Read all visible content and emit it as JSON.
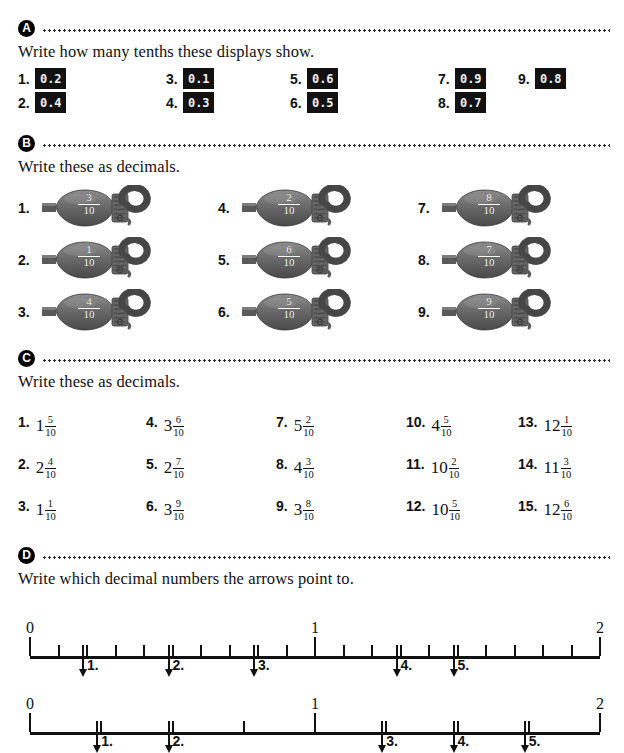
{
  "sections": {
    "a": {
      "badge": "A",
      "instruction": "Write how many tenths these displays show.",
      "items": [
        {
          "num": "1.",
          "display": "0.2"
        },
        {
          "num": "2.",
          "display": "0.4"
        },
        {
          "num": "3.",
          "display": "0.1"
        },
        {
          "num": "4.",
          "display": "0.3"
        },
        {
          "num": "5.",
          "display": "0.6"
        },
        {
          "num": "6.",
          "display": "0.5"
        },
        {
          "num": "7.",
          "display": "0.9"
        },
        {
          "num": "8.",
          "display": "0.7"
        },
        {
          "num": "9.",
          "display": "0.8"
        }
      ]
    },
    "b": {
      "badge": "B",
      "instruction": "Write these as decimals.",
      "items": [
        {
          "num": "1.",
          "numerator": "3",
          "denominator": "10"
        },
        {
          "num": "2.",
          "numerator": "1",
          "denominator": "10"
        },
        {
          "num": "3.",
          "numerator": "4",
          "denominator": "10"
        },
        {
          "num": "4.",
          "numerator": "2",
          "denominator": "10"
        },
        {
          "num": "5.",
          "numerator": "6",
          "denominator": "10"
        },
        {
          "num": "6.",
          "numerator": "5",
          "denominator": "10"
        },
        {
          "num": "7.",
          "numerator": "8",
          "denominator": "10"
        },
        {
          "num": "8.",
          "numerator": "7",
          "denominator": "10"
        },
        {
          "num": "9.",
          "numerator": "9",
          "denominator": "10"
        }
      ]
    },
    "c": {
      "badge": "C",
      "instruction": "Write these as decimals.",
      "items": [
        {
          "num": "1.",
          "whole": "1",
          "numerator": "5",
          "denominator": "10"
        },
        {
          "num": "2.",
          "whole": "2",
          "numerator": "4",
          "denominator": "10"
        },
        {
          "num": "3.",
          "whole": "1",
          "numerator": "1",
          "denominator": "10"
        },
        {
          "num": "4.",
          "whole": "3",
          "numerator": "6",
          "denominator": "10"
        },
        {
          "num": "5.",
          "whole": "2",
          "numerator": "7",
          "denominator": "10"
        },
        {
          "num": "6.",
          "whole": "3",
          "numerator": "9",
          "denominator": "10"
        },
        {
          "num": "7.",
          "whole": "5",
          "numerator": "2",
          "denominator": "10"
        },
        {
          "num": "8.",
          "whole": "4",
          "numerator": "3",
          "denominator": "10"
        },
        {
          "num": "9.",
          "whole": "3",
          "numerator": "8",
          "denominator": "10"
        },
        {
          "num": "10.",
          "whole": "4",
          "numerator": "5",
          "denominator": "10"
        },
        {
          "num": "11.",
          "whole": "10",
          "numerator": "2",
          "denominator": "10"
        },
        {
          "num": "12.",
          "whole": "10",
          "numerator": "5",
          "denominator": "10"
        },
        {
          "num": "13.",
          "whole": "12",
          "numerator": "1",
          "denominator": "10"
        },
        {
          "num": "14.",
          "whole": "11",
          "numerator": "3",
          "denominator": "10"
        },
        {
          "num": "15.",
          "whole": "12",
          "numerator": "6",
          "denominator": "10"
        }
      ]
    },
    "d": {
      "badge": "D",
      "instruction": "Write which decimal numbers the arrows point to.",
      "numberlines": [
        {
          "min": 0,
          "max": 2,
          "labels": [
            {
              "text": "0",
              "value": 0
            },
            {
              "text": "1",
              "value": 1
            },
            {
              "text": "2",
              "value": 2
            }
          ],
          "tick_step": 0.1,
          "major_values": [
            0,
            1,
            2
          ],
          "arrows": [
            {
              "label": "1.",
              "value": 0.2
            },
            {
              "label": "2.",
              "value": 0.5
            },
            {
              "label": "3.",
              "value": 0.8
            },
            {
              "label": "4.",
              "value": 1.3
            },
            {
              "label": "5.",
              "value": 1.5
            }
          ]
        },
        {
          "min": 0,
          "max": 2,
          "labels": [
            {
              "text": "0",
              "value": 0
            },
            {
              "text": "1",
              "value": 1
            },
            {
              "text": "2",
              "value": 2
            }
          ],
          "tick_step": 0.25,
          "major_values": [
            0,
            1,
            2
          ],
          "arrows": [
            {
              "label": "1.",
              "value": 0.25
            },
            {
              "label": "2.",
              "value": 0.5
            },
            {
              "label": "3.",
              "value": 1.25
            },
            {
              "label": "4.",
              "value": 1.5
            },
            {
              "label": "5.",
              "value": 1.75
            }
          ]
        }
      ]
    }
  },
  "layout": {
    "a_columns_x": [
      0,
      148,
      272,
      420,
      500
    ],
    "b_columns_x": [
      0,
      200,
      400
    ],
    "c_columns_x": [
      0,
      128,
      258,
      388,
      500
    ],
    "colors": {
      "ink": "#111111",
      "lcd_bg": "#111111",
      "lcd_fg": "#f2f2f2",
      "lock_body": "#6f6f6f"
    }
  }
}
